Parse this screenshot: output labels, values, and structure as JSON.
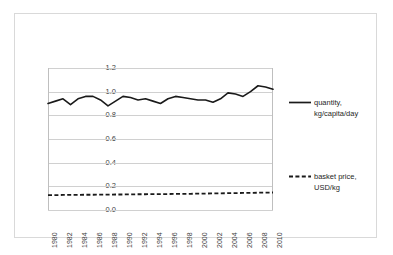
{
  "chart_data": {
    "type": "line",
    "title": "",
    "xlabel": "",
    "ylabel": "",
    "ylim": [
      0.0,
      1.2
    ],
    "xlim": [
      1980,
      2010
    ],
    "grid": true,
    "legend_position": "right",
    "y_ticks": [
      "0.0",
      "0.2",
      "0.4",
      "0.6",
      "0.8",
      "1.0",
      "1.2"
    ],
    "y_tick_values": [
      0.0,
      0.2,
      0.4,
      0.6,
      0.8,
      1.0,
      1.2
    ],
    "x_ticks": [
      "1980",
      "1982",
      "1984",
      "1986",
      "1988",
      "1990",
      "1992",
      "1994",
      "1996",
      "1998",
      "2000",
      "2002",
      "2004",
      "2006",
      "2008",
      "2010"
    ],
    "x": [
      1980,
      1981,
      1982,
      1983,
      1984,
      1985,
      1986,
      1987,
      1988,
      1989,
      1990,
      1991,
      1992,
      1993,
      1994,
      1995,
      1996,
      1997,
      1998,
      1999,
      2000,
      2001,
      2002,
      2003,
      2004,
      2005,
      2006,
      2007,
      2008,
      2009,
      2010
    ],
    "series": [
      {
        "name": "quantity, kg/capita/day",
        "style": "solid",
        "color": "#1a1a1a",
        "values": [
          0.9,
          0.92,
          0.94,
          0.89,
          0.94,
          0.96,
          0.96,
          0.93,
          0.88,
          0.92,
          0.96,
          0.95,
          0.93,
          0.94,
          0.92,
          0.9,
          0.94,
          0.96,
          0.95,
          0.94,
          0.93,
          0.93,
          0.91,
          0.94,
          0.99,
          0.98,
          0.96,
          1.0,
          1.05,
          1.04,
          1.02
        ]
      },
      {
        "name": "basket price, USD/kg",
        "style": "dashed",
        "color": "#1a1a1a",
        "values": [
          0.125,
          0.126,
          0.127,
          0.128,
          0.128,
          0.129,
          0.129,
          0.13,
          0.13,
          0.131,
          0.131,
          0.132,
          0.133,
          0.133,
          0.134,
          0.134,
          0.135,
          0.136,
          0.136,
          0.137,
          0.138,
          0.139,
          0.14,
          0.141,
          0.142,
          0.143,
          0.144,
          0.145,
          0.146,
          0.147,
          0.148
        ]
      }
    ]
  },
  "legend": {
    "quantity_label": "quantity,\nkg/capita/day",
    "price_label": "basket price,\nUSD/kg"
  },
  "colors": {
    "series_line": "#1a1a1a",
    "gridline": "#d0d0d0",
    "axis": "#bfbfbf",
    "frame": "#d9d9d9",
    "tick_text": "#404040",
    "legend_text": "#262626",
    "background": "#ffffff"
  }
}
